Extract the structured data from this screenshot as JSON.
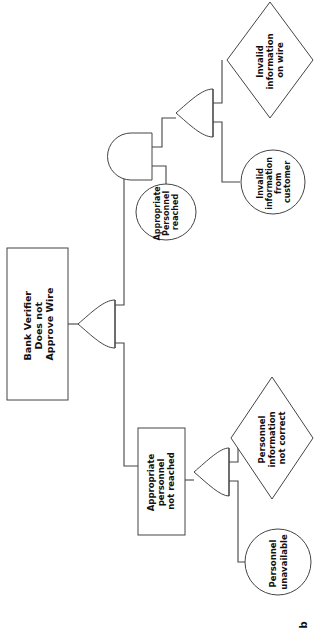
{
  "figure": {
    "label": "b",
    "orientation": "rotated-90-ccw",
    "type": "fault-tree"
  },
  "nodes": {
    "top_event": {
      "id": "top-event",
      "shape": "rectangle",
      "label": "Bank Verifier Does not Approve Wire",
      "lines": [
        "Bank Verifier",
        "Does not",
        "Approve Wire"
      ]
    },
    "intermediate_not_reached": {
      "id": "appropriate-personnel-not-reached",
      "shape": "rectangle",
      "label": "Appropriate personnel not reached",
      "lines": [
        "Appropriate",
        "personnel",
        "not reached"
      ]
    },
    "condition_reached": {
      "id": "appropriate-personnel-reached",
      "shape": "ellipse",
      "label": "Appropriate Personnel reached",
      "lines": [
        "Appropriate",
        "Personnel",
        "reached"
      ]
    },
    "basic_invalid_wire": {
      "id": "invalid-information-on-wire",
      "shape": "diamond",
      "label": "Invalid information on wire",
      "lines": [
        "Invalid",
        "information",
        "on wire"
      ]
    },
    "basic_invalid_customer": {
      "id": "invalid-information-from-customer",
      "shape": "circle",
      "label": "Invalid information from customer",
      "lines": [
        "Invalid",
        "information",
        "from",
        "customer"
      ]
    },
    "basic_personnel_info": {
      "id": "personnel-information-not-correct",
      "shape": "diamond",
      "label": "Personnel information not correct",
      "lines": [
        "Personnel",
        "information",
        "not correct"
      ]
    },
    "basic_personnel_unavailable": {
      "id": "personnel-unavailable",
      "shape": "circle",
      "label": "Personnel unavailable",
      "lines": [
        "Personnel",
        "unavailable"
      ]
    }
  },
  "gates": [
    {
      "id": "gate-top-or",
      "type": "OR",
      "name": "top-or-gate"
    },
    {
      "id": "gate-and",
      "type": "AND",
      "name": "and-gate"
    },
    {
      "id": "gate-wire-or",
      "type": "OR",
      "name": "invalid-information-or-gate"
    },
    {
      "id": "gate-personnel-or",
      "type": "OR",
      "name": "personnel-or-gate"
    }
  ],
  "colors": {
    "stroke": "#444444",
    "fill": "#ffffff",
    "text": "#111111",
    "background": "#ffffff"
  }
}
